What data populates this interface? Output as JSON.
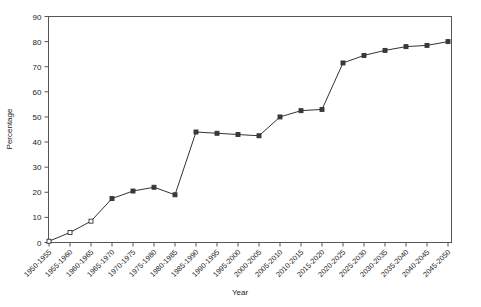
{
  "chart_data": {
    "type": "line",
    "title": "",
    "xlabel": "Year",
    "ylabel": "Percentage",
    "ylim": [
      0,
      90
    ],
    "yticks": [
      0,
      10,
      20,
      30,
      40,
      50,
      60,
      70,
      80,
      90
    ],
    "grid": false,
    "legend": "none",
    "marker": "square",
    "line_color": "#333333",
    "categories": [
      "1950-1955",
      "1955-1960",
      "1960-1965",
      "1965-1970",
      "1970-1975",
      "1975-1980",
      "1980-1985",
      "1985-1990",
      "1990-1995",
      "1995-2000",
      "2000-2005",
      "2005-2010",
      "2010-2015",
      "2015-2020",
      "2020-2025",
      "2025-2030",
      "2030-2035",
      "2035-2040",
      "2040-2045",
      "2045-2050"
    ],
    "values": [
      0.5,
      4.0,
      8.5,
      17.5,
      20.5,
      22.0,
      19.0,
      44.0,
      43.5,
      43.0,
      42.5,
      50.0,
      52.5,
      53.0,
      71.5,
      74.5,
      76.5,
      78.0,
      78.5,
      80.0
    ]
  }
}
